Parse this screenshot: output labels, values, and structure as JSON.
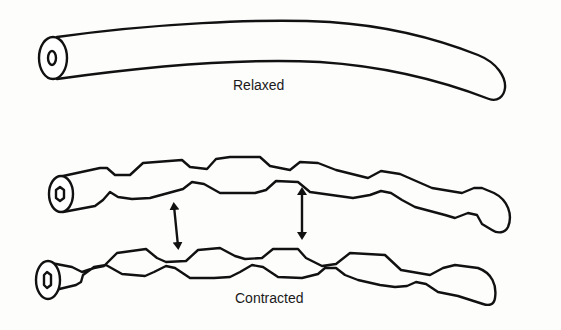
{
  "diagram": {
    "type": "illustration",
    "labels": {
      "relaxed": "Relaxed",
      "contracted": "Contracted"
    },
    "elements": [
      {
        "name": "relaxed-tube",
        "description": "smooth curved cylindrical tube with open end"
      },
      {
        "name": "contracted-tube-upper",
        "description": "tube with periodic constrictions (bumps)"
      },
      {
        "name": "contracted-tube-lower",
        "description": "tube with periodic constrictions (bumps)"
      },
      {
        "name": "double-arrow-left",
        "description": "vertical double-headed arrow between contracted tubes"
      },
      {
        "name": "double-arrow-right",
        "description": "vertical double-headed arrow between contracted tubes"
      }
    ],
    "colors": {
      "line": "#111111",
      "background": "#fdfdfc"
    }
  }
}
